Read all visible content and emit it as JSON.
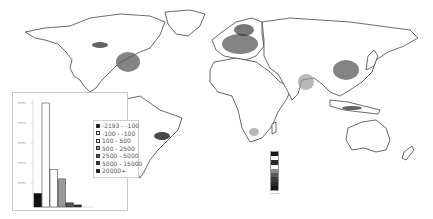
{
  "map": {
    "type": "world population density choropleth (grayscale)",
    "projection": "equirectangular",
    "high_density_regions": [
      "Eastern United States",
      "Europe",
      "India",
      "Eastern China",
      "Java",
      "Southeast Brazil",
      "Nile valley"
    ]
  },
  "colorbar": {
    "colors": [
      "#1a1a1a",
      "#ffffff",
      "#2a2a2a",
      "#ffffff",
      "#8a8a8a",
      "#5a5a5a",
      "#3a3a3a",
      "#2a2a2a",
      "#111111"
    ]
  },
  "legend": {
    "items": [
      {
        "label": "-2193 - -100",
        "color": "#111111"
      },
      {
        "label": "-100 - -100",
        "color": "#ffffff"
      },
      {
        "label": "100 - 500",
        "color": "#ffffff"
      },
      {
        "label": "500 - 2500",
        "color": "#9a9a9a"
      },
      {
        "label": "2500 - 5000",
        "color": "#555555"
      },
      {
        "label": "5000 - 15000",
        "color": "#333333"
      },
      {
        "label": "20000+",
        "color": "#111111"
      }
    ]
  },
  "chart_data": {
    "type": "bar",
    "title": "",
    "xlabel": "",
    "ylabel": "",
    "categories": [
      "-2193 - -100",
      "-100 - -100",
      "100 - 500",
      "500 - 2500",
      "2500 - 5000",
      "5000 - 15000",
      "20000+"
    ],
    "values": [
      13,
      100,
      36,
      27,
      4,
      2,
      0
    ],
    "value_units": "relative (axis tick labels illegible)",
    "bar_colors": [
      "#111111",
      "#ffffff",
      "#ffffff",
      "#9a9a9a",
      "#555555",
      "#333333",
      "#111111"
    ],
    "yticks_count": 6,
    "grid": false,
    "legend_position": "right, inside inset"
  }
}
